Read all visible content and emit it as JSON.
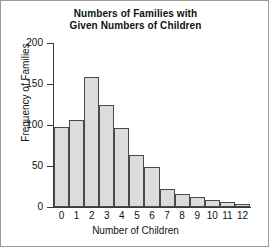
{
  "chart_data": {
    "type": "bar",
    "title": "Numbers of Families with Given Numbers of Children",
    "title_lines": [
      "Numbers of Families with",
      "Given Numbers of Children"
    ],
    "xlabel": "Number of Children",
    "ylabel": "Frequency of Families",
    "categories": [
      "0",
      "1",
      "2",
      "3",
      "4",
      "5",
      "6",
      "7",
      "8",
      "9",
      "10",
      "11",
      "12"
    ],
    "values": [
      98,
      106,
      158,
      125,
      96,
      63,
      49,
      22,
      16,
      12,
      8,
      6,
      4
    ],
    "ylim": [
      0,
      200
    ],
    "yticks": [
      0,
      50,
      100,
      150,
      200
    ],
    "ytick_labels": [
      "0",
      "50",
      "100",
      "150",
      "200"
    ],
    "grid": false,
    "legend": null,
    "bar_fill": "#dcdcdc",
    "bar_edge": "#4a4a4a",
    "axis_color": "#3a3a3a",
    "background": "#ffffff"
  }
}
